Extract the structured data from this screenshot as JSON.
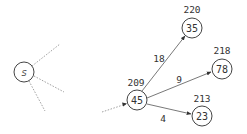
{
  "diagram": {
    "type": "shortest-path-graph",
    "nodes": {
      "source": {
        "label": "s"
      },
      "n45": {
        "label": "45",
        "distance": "209"
      },
      "n35": {
        "label": "35",
        "distance": "220"
      },
      "n78": {
        "label": "78",
        "distance": "218"
      },
      "n23": {
        "label": "23",
        "distance": "213"
      }
    },
    "edges": [
      {
        "from": "45",
        "to": "35",
        "weight": "18"
      },
      {
        "from": "45",
        "to": "78",
        "weight": "9"
      },
      {
        "from": "45",
        "to": "23",
        "weight": "4"
      }
    ],
    "colors": {
      "node_stroke": "#444444",
      "edge": "#555555",
      "dotted_edge": "#888888",
      "text": "#333333"
    }
  }
}
